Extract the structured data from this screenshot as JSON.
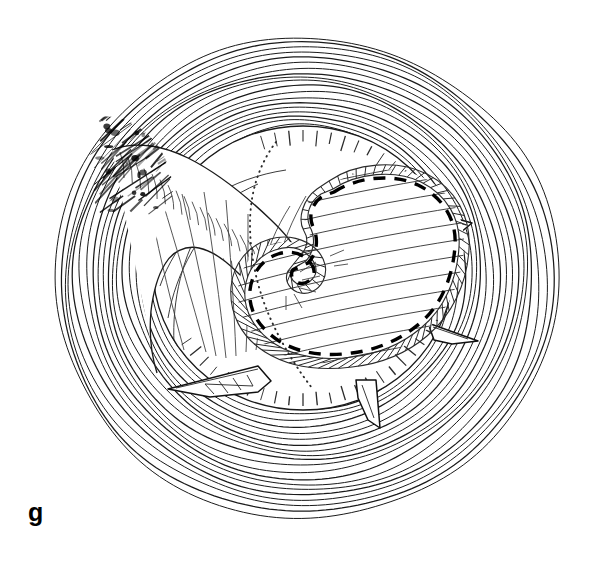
{
  "figure": {
    "panel_label": "g",
    "domain_kind": "scientific-line-drawing",
    "background_color": "#ffffff",
    "ink_color": "#1a1a1a",
    "width": 596,
    "height": 561
  },
  "structures": {
    "outer_shell": {
      "name": "concentric growth rings",
      "ring_count": 26,
      "center_x": 300,
      "center_y": 268,
      "outer_radius_x": 252,
      "outer_radius_y": 240,
      "inner_radius_x": 112,
      "inner_radius_y": 108,
      "stroke_width": 1.15
    },
    "shading_patch": {
      "name": "dark shaded convergence zone",
      "position": "upper-left",
      "center_x": 127,
      "center_y": 168,
      "stroke_count": 54
    },
    "inner_disc": {
      "name": "central disc",
      "center_x": 303,
      "center_y": 268,
      "radius_x": 150,
      "radius_y": 142,
      "rim_tick_count": 64
    },
    "lobe": {
      "name": "S-shaped lobed body",
      "outline_style": "heavy-dashed-with-beaded-margin",
      "dash_pattern": "12 9",
      "interior_hatch_lines": 9
    },
    "tongue": {
      "name": "finger-like ribbed lobe",
      "position": "left-of-centre",
      "rib_count": 22
    },
    "spines": [
      {
        "id": "spine-left",
        "position": "lower-left",
        "direction": "left",
        "hatched": true
      },
      {
        "id": "spine-right-upper",
        "position": "right-upper",
        "direction": "right",
        "hatched": false
      },
      {
        "id": "spine-right-lower",
        "position": "right-lower",
        "direction": "right",
        "hatched": false
      },
      {
        "id": "spine-bottom",
        "position": "bottom",
        "direction": "down",
        "hatched": false
      }
    ]
  }
}
